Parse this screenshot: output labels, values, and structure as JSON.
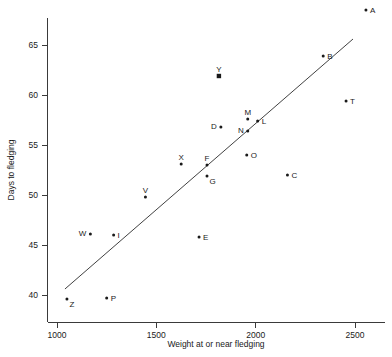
{
  "chart_data": {
    "type": "scatter",
    "title": "",
    "subtitle": "",
    "xlabel": "Weight at or near fledging",
    "ylabel": "Days to fledging",
    "xlim": [
      950,
      2620
    ],
    "ylim": [
      38.2,
      68.8
    ],
    "xticks": [
      1000,
      1500,
      2000,
      2500
    ],
    "xtick_labels": [
      "1000",
      "1500",
      "2000",
      "2500"
    ],
    "yticks": [
      40,
      45,
      50,
      55,
      60,
      65
    ],
    "ytick_labels": [
      "40",
      "45",
      "50",
      "55",
      "60",
      "65"
    ],
    "grid": false,
    "legend": null,
    "points": [
      {
        "label": "A",
        "x": 2555,
        "y": 68.5,
        "marker": "dot",
        "label_pos": "right"
      },
      {
        "label": "B",
        "x": 2340,
        "y": 63.9,
        "marker": "dot",
        "label_pos": "right"
      },
      {
        "label": "Y",
        "x": 1815,
        "y": 61.9,
        "marker": "square",
        "label_pos": "above"
      },
      {
        "label": "T",
        "x": 2455,
        "y": 59.4,
        "marker": "dot",
        "label_pos": "right"
      },
      {
        "label": "M",
        "x": 1960,
        "y": 57.6,
        "marker": "dot",
        "label_pos": "above"
      },
      {
        "label": "L",
        "x": 2010,
        "y": 57.4,
        "marker": "dot",
        "label_pos": "right"
      },
      {
        "label": "D",
        "x": 1825,
        "y": 56.8,
        "marker": "dot",
        "label_pos": "left"
      },
      {
        "label": "N",
        "x": 1960,
        "y": 56.4,
        "marker": "dot",
        "label_pos": "left"
      },
      {
        "label": "O",
        "x": 1955,
        "y": 54.0,
        "marker": "dot",
        "label_pos": "right"
      },
      {
        "label": "X",
        "x": 1625,
        "y": 53.1,
        "marker": "dot",
        "label_pos": "above"
      },
      {
        "label": "F",
        "x": 1755,
        "y": 53.0,
        "marker": "dot",
        "label_pos": "above"
      },
      {
        "label": "C",
        "x": 2160,
        "y": 52.0,
        "marker": "dot",
        "label_pos": "right"
      },
      {
        "label": "G",
        "x": 1755,
        "y": 51.9,
        "marker": "dot",
        "label_pos": "below-right"
      },
      {
        "label": "V",
        "x": 1445,
        "y": 49.8,
        "marker": "dot",
        "label_pos": "above"
      },
      {
        "label": "W",
        "x": 1168,
        "y": 46.1,
        "marker": "dot",
        "label_pos": "left"
      },
      {
        "label": "I",
        "x": 1285,
        "y": 46.0,
        "marker": "dot",
        "label_pos": "right"
      },
      {
        "label": "E",
        "x": 1715,
        "y": 45.8,
        "marker": "dot",
        "label_pos": "right"
      },
      {
        "label": "Z",
        "x": 1050,
        "y": 39.6,
        "marker": "dot",
        "label_pos": "below-right"
      },
      {
        "label": "P",
        "x": 1250,
        "y": 39.7,
        "marker": "dot",
        "label_pos": "right"
      }
    ],
    "fit_line": {
      "name": "regression-line",
      "x_start": 1040,
      "y_start": 40.6,
      "x_end": 2490,
      "y_end": 65.6
    }
  },
  "style": {
    "axis_color": "#3a3a3a",
    "marker_color": "#1a1a1a",
    "line_color": "#2b2b2b",
    "background": "#ffffff"
  }
}
